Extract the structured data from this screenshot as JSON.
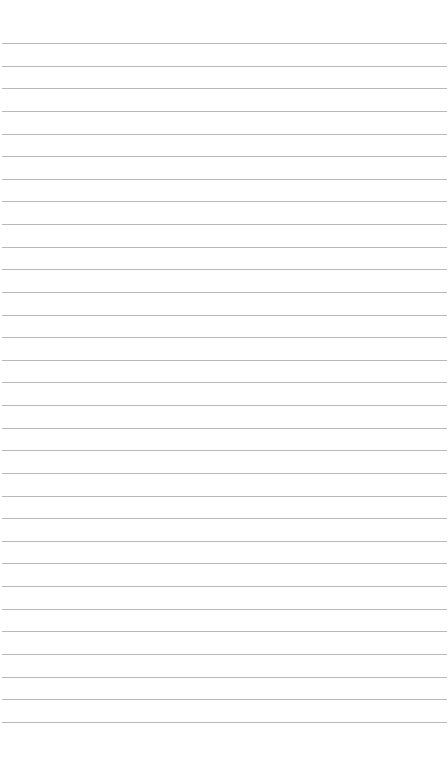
{
  "page": {
    "type": "lined-paper",
    "background_color": "#ffffff",
    "line_color": "#b8b8b8",
    "line_count": 31,
    "first_line_y": 43,
    "line_spacing": 22.63
  }
}
